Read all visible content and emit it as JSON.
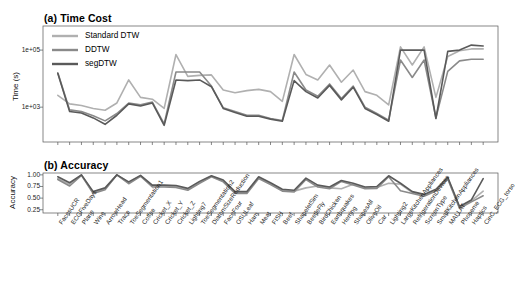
{
  "figure": {
    "panel_a_title": "(a) Time Cost",
    "panel_b_title": "(b) Accuracy"
  },
  "legend": {
    "position": "top-left-inside",
    "items": [
      {
        "label": "Standard DTW",
        "color": "#b0b0b0"
      },
      {
        "label": "DDTW",
        "color": "#8a8a8a"
      },
      {
        "label": "segDTW",
        "color": "#5a5a5a"
      }
    ]
  },
  "chart_data": [
    {
      "type": "line",
      "title": "(a) Time Cost",
      "xlabel": "",
      "ylabel": "Time (s)",
      "yscale": "log",
      "ytick_labels": [
        "1e+05",
        "1e+03"
      ],
      "ytick_values": [
        100000,
        1000
      ],
      "ylim": [
        60,
        700000
      ],
      "grid": false,
      "legend": [
        "Standard DTW",
        "DDTW",
        "segDTW"
      ],
      "categories": [
        "FacesUCR",
        "ECGFiveDays",
        "Plane",
        "Wine",
        "ArrowHead",
        "Trace",
        "ToeSegmentation1",
        "Coffee",
        "Cricket_X",
        "Cricket_Y",
        "Cricket_Z",
        "Lighting7",
        "ToeSegmentation2",
        "DiatomSizeReduction",
        "FaceFour",
        "OSULeaf",
        "Ham",
        "Meat",
        "FISH",
        "Beef",
        "ShapeletSim",
        "BeetleFly",
        "BirdChicken",
        "Earthquakes",
        "Herring",
        "ShapesAll",
        "OliveOil",
        "Car",
        "Lighting2",
        "LargeKitchenAppliances",
        "RefrigerationDevices",
        "ScreenType",
        "SmallKitchenAppliances",
        "MALLAT",
        "Phoneme",
        "Haptics",
        "CinC_ECG_torso"
      ],
      "series": [
        {
          "name": "Standard DTW",
          "color": "#b0b0b0",
          "values": [
            2600,
            1300,
            1150,
            900,
            780,
            1400,
            9000,
            2200,
            1900,
            900,
            70000,
            12000,
            13000,
            13500,
            4000,
            3200,
            3800,
            4200,
            3500,
            1600,
            70000,
            14000,
            9000,
            30000,
            7500,
            20000,
            3500,
            2600,
            1200,
            130000,
            30000,
            130000,
            2200,
            60000,
            95000,
            110000,
            110000
          ]
        },
        {
          "name": "DDTW",
          "color": "#8a8a8a",
          "values": [
            16000,
            800,
            700,
            500,
            330,
            600,
            1400,
            1200,
            1500,
            260,
            17000,
            17000,
            17000,
            5500,
            950,
            700,
            520,
            520,
            400,
            340,
            17000,
            4000,
            2400,
            6500,
            2000,
            5500,
            1000,
            600,
            350,
            45000,
            11000,
            45000,
            420,
            18000,
            42000,
            48000,
            48000
          ]
        },
        {
          "name": "segDTW",
          "color": "#5a5a5a",
          "values": [
            15000,
            700,
            620,
            420,
            250,
            520,
            1300,
            1100,
            1400,
            230,
            9000,
            8500,
            9000,
            5200,
            900,
            650,
            480,
            480,
            380,
            320,
            8500,
            3500,
            2100,
            5800,
            1800,
            5000,
            900,
            550,
            320,
            100000,
            100000,
            100000,
            400,
            90000,
            100000,
            150000,
            140000
          ]
        }
      ]
    },
    {
      "type": "line",
      "title": "(b) Accuracy",
      "xlabel": "",
      "ylabel": "Accuracy",
      "ytick_labels": [
        "1.00",
        "0.75",
        "0.50",
        "0.25"
      ],
      "ytick_values": [
        1.0,
        0.75,
        0.5,
        0.25
      ],
      "ylim": [
        0.18,
        1.04
      ],
      "grid": false,
      "legend": [
        "Standard DTW",
        "DDTW",
        "segDTW"
      ],
      "categories": [
        "FacesUCR",
        "ECGFiveDays",
        "Plane",
        "Wine",
        "ArrowHead",
        "Trace",
        "ToeSegmentation1",
        "Coffee",
        "Cricket_X",
        "Cricket_Y",
        "Cricket_Z",
        "Lighting7",
        "ToeSegmentation2",
        "DiatomSizeReduction",
        "FaceFour",
        "OSULeaf",
        "Ham",
        "Meat",
        "FISH",
        "Beef",
        "ShapeletSim",
        "BeetleFly",
        "BirdChicken",
        "Earthquakes",
        "Herring",
        "ShapesAll",
        "OliveOil",
        "Car",
        "Lighting2",
        "LargeKitchenAppliances",
        "RefrigerationDevices",
        "ScreenType",
        "SmallKitchenAppliances",
        "MALLAT",
        "Phoneme",
        "Haptics",
        "CinC_ECG_torso"
      ],
      "series": [
        {
          "name": "Standard DTW",
          "color": "#b0b0b0",
          "values": [
            0.92,
            0.8,
            1.0,
            0.61,
            0.7,
            1.0,
            0.83,
            0.98,
            0.76,
            0.76,
            0.75,
            0.69,
            0.84,
            0.97,
            0.87,
            0.62,
            0.62,
            0.94,
            0.81,
            0.67,
            0.65,
            0.72,
            0.76,
            0.72,
            0.7,
            0.8,
            0.72,
            0.73,
            0.82,
            0.8,
            0.62,
            0.56,
            0.67,
            0.93,
            0.3,
            0.44,
            0.65
          ]
        },
        {
          "name": "DDTW",
          "color": "#8a8a8a",
          "values": [
            0.9,
            0.76,
            0.99,
            0.6,
            0.68,
            1.0,
            0.81,
            0.97,
            0.74,
            0.74,
            0.73,
            0.67,
            0.82,
            0.96,
            0.85,
            0.6,
            0.6,
            0.92,
            0.79,
            0.65,
            0.63,
            0.9,
            0.74,
            0.7,
            0.86,
            0.78,
            0.7,
            0.71,
            0.96,
            0.66,
            0.6,
            0.54,
            0.65,
            0.91,
            0.28,
            0.42,
            0.55
          ]
        },
        {
          "name": "segDTW",
          "color": "#5a5a5a",
          "values": [
            0.96,
            0.83,
            1.0,
            0.64,
            0.72,
            1.0,
            0.85,
            0.99,
            0.78,
            0.78,
            0.77,
            0.71,
            0.86,
            0.98,
            0.89,
            0.64,
            0.64,
            0.96,
            0.83,
            0.69,
            0.67,
            0.93,
            0.78,
            0.74,
            0.88,
            0.82,
            0.74,
            0.75,
            0.98,
            0.82,
            0.64,
            0.58,
            0.69,
            0.95,
            0.32,
            0.46,
            0.92
          ]
        }
      ]
    }
  ]
}
